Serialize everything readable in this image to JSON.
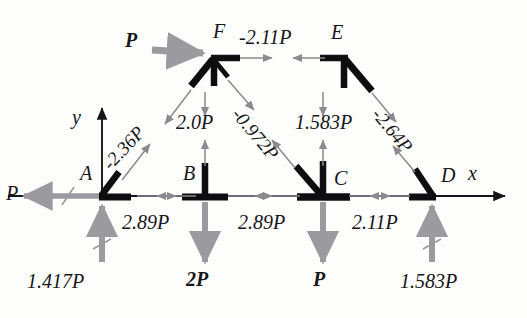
{
  "figure": {
    "type": "free-body / method-of-joints truss diagram",
    "axes": {
      "x_label": "x",
      "y_label": "y"
    }
  },
  "nodes": [
    {
      "id": "A",
      "label": "A",
      "x": 102,
      "y": 196
    },
    {
      "id": "B",
      "label": "B",
      "x": 205,
      "y": 196
    },
    {
      "id": "C",
      "label": "C",
      "x": 323,
      "y": 196
    },
    {
      "id": "D",
      "label": "D",
      "x": 432,
      "y": 196
    },
    {
      "id": "E",
      "label": "E",
      "x": 343,
      "y": 56
    },
    {
      "id": "F",
      "label": "F",
      "x": 214,
      "y": 56
    }
  ],
  "member_forces": [
    {
      "name": "AB",
      "label": "2.89P",
      "x": 153,
      "y": 222
    },
    {
      "name": "BC",
      "label": "2.89P",
      "x": 262,
      "y": 222
    },
    {
      "name": "CD",
      "label": "2.11P",
      "x": 378,
      "y": 222
    },
    {
      "name": "FE",
      "label": "-2.11P",
      "x": 244,
      "y": 40
    },
    {
      "name": "AF",
      "label": "-2.36P",
      "x": 118,
      "y": 160,
      "rotation": -47
    },
    {
      "name": "FB",
      "label": "2.0P",
      "x": 186,
      "y": 124
    },
    {
      "name": "FC",
      "label": "-0.972P",
      "x": 244,
      "y": 110,
      "rotation": 50
    },
    {
      "name": "EC",
      "label": "1.583P",
      "x": 309,
      "y": 124
    },
    {
      "name": "ED",
      "label": "-2.64P",
      "x": 382,
      "y": 112,
      "rotation": 50
    }
  ],
  "applied_loads": [
    {
      "name": "load-P-at-F",
      "label": "P",
      "x": 128,
      "y": 41,
      "bold": true
    },
    {
      "name": "reaction-at-A",
      "label": "1.417P",
      "x": 33,
      "y": 283,
      "bold": false
    },
    {
      "name": "load-2P-at-B",
      "label": "2P",
      "x": 192,
      "y": 281,
      "bold": true
    },
    {
      "name": "load-P-at-C",
      "label": "P",
      "x": 317,
      "y": 281,
      "bold": true
    },
    {
      "name": "reaction-at-D",
      "label": "1.583P",
      "x": 408,
      "y": 283,
      "bold": false
    },
    {
      "name": "load-P-at-A",
      "label": "P",
      "x": 6,
      "y": 189,
      "bold": false
    }
  ],
  "axis_labels": [
    {
      "name": "y-axis-label",
      "label": "y",
      "x": 72,
      "y": 117
    },
    {
      "name": "x-axis-label",
      "label": "x",
      "x": 468,
      "y": 168
    }
  ],
  "colors": {
    "member": "#0e0e10",
    "force_arrow": "#8a8a8f",
    "load_arrow": "#9a9a9f",
    "axis": "#16161a",
    "background": "#fdfdfb"
  }
}
